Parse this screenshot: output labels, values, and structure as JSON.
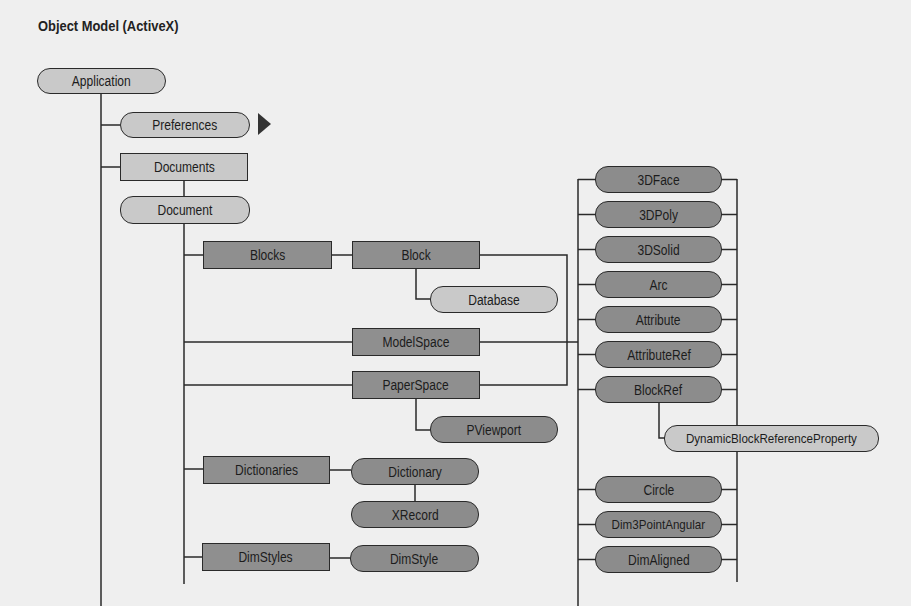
{
  "title": "Object Model (ActiveX)",
  "colors": {
    "background": "#efefef",
    "light_node": "#c9c9c9",
    "dark_node": "#8c8c8c",
    "line": "#2a2a2a"
  },
  "nodes": {
    "application": "Application",
    "preferences": "Preferences",
    "documents": "Documents",
    "document": "Document",
    "blocks": "Blocks",
    "block": "Block",
    "database": "Database",
    "modelspace": "ModelSpace",
    "paperspace": "PaperSpace",
    "pviewport": "PViewport",
    "dictionaries": "Dictionaries",
    "dictionary": "Dictionary",
    "xrecord": "XRecord",
    "dimstyles": "DimStyles",
    "dimstyle": "DimStyle",
    "dynblockrefprop": "DynamicBlockReferenceProperty"
  },
  "entities": [
    "3DFace",
    "3DPoly",
    "3DSolid",
    "Arc",
    "Attribute",
    "AttributeRef",
    "BlockRef",
    "Circle",
    "Dim3PointAngular",
    "DimAligned"
  ],
  "more_indicator_icon": "right-triangle-icon"
}
